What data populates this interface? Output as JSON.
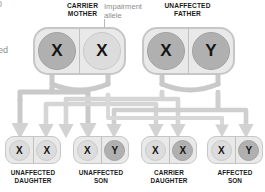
{
  "diagram": {
    "edge_fragments": {
      "top_left": "0",
      "mid_left": "red"
    },
    "colors": {
      "allele_dark": "#b0b0b0",
      "allele_light": "#dcdcdc",
      "capsule_fill": "#e9e9e9",
      "capsule_border": "#c6c6c6",
      "pipe": "#c9c9c9",
      "pipe_light": "#d8d8d8",
      "label_text": "#1a1a1a",
      "annotation_text": "#8c8c8c",
      "background": "#ffffff"
    },
    "annotation": {
      "label": "Impairment\nallele",
      "points_to": "carrier-mother-allele-2"
    },
    "parents": [
      {
        "id": "carrier-mother",
        "label": "CARRIER\nMOTHER",
        "alleles": [
          {
            "symbol": "X",
            "shade": "dark"
          },
          {
            "symbol": "X",
            "shade": "light"
          }
        ]
      },
      {
        "id": "unaffected-father",
        "label": "UNAFFECTED\nFATHER",
        "alleles": [
          {
            "symbol": "X",
            "shade": "dark"
          },
          {
            "symbol": "Y",
            "shade": "dark"
          }
        ]
      }
    ],
    "children": [
      {
        "id": "unaffected-daughter",
        "label": "UNAFFECTED\nDAUGHTER",
        "alleles": [
          {
            "symbol": "X",
            "shade": "light"
          },
          {
            "symbol": "X",
            "shade": "light"
          }
        ]
      },
      {
        "id": "unaffected-son",
        "label": "UNAFFECTED\nSON",
        "alleles": [
          {
            "symbol": "X",
            "shade": "light"
          },
          {
            "symbol": "Y",
            "shade": "dark"
          }
        ]
      },
      {
        "id": "carrier-daughter",
        "label": "CARRIER\nDAUGHTER",
        "alleles": [
          {
            "symbol": "X",
            "shade": "light"
          },
          {
            "symbol": "X",
            "shade": "dark"
          }
        ]
      },
      {
        "id": "affected-son",
        "label": "AFFECTED\nSON",
        "alleles": [
          {
            "symbol": "X",
            "shade": "light"
          },
          {
            "symbol": "Y",
            "shade": "dark"
          }
        ]
      }
    ]
  }
}
